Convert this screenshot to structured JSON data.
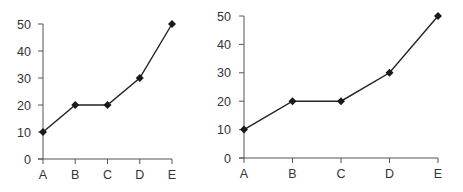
{
  "chart_data": [
    {
      "type": "line",
      "title": "",
      "xlabel": "",
      "ylabel": "",
      "categories": [
        "A",
        "B",
        "C",
        "D",
        "E"
      ],
      "values": [
        10,
        20,
        20,
        30,
        50
      ],
      "ylim": [
        0,
        50
      ],
      "yticks": [
        0,
        10,
        20,
        30,
        40,
        50
      ],
      "grid": false,
      "legend": "none",
      "marker": "diamond",
      "color": "#222222"
    },
    {
      "type": "line",
      "title": "",
      "xlabel": "",
      "ylabel": "",
      "categories": [
        "A",
        "B",
        "C",
        "D",
        "E"
      ],
      "values": [
        10,
        20,
        20,
        30,
        50
      ],
      "ylim": [
        0,
        50
      ],
      "yticks": [
        0,
        10,
        20,
        30,
        40,
        50
      ],
      "grid": false,
      "legend": "none",
      "marker": "diamond",
      "color": "#222222"
    }
  ]
}
